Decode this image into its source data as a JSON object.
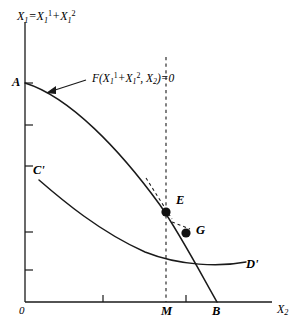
{
  "figure": {
    "type": "economics-transformation-curve-diagram",
    "background_color": "#ffffff",
    "line_color": "#1a1a1a"
  },
  "axes": {
    "y_axis": {
      "name": "vertical-axis",
      "label_parts": {
        "base": "X",
        "base_sub": "1",
        "equals": "=",
        "term1_base": "X",
        "term1_sub": "1",
        "term1_sup": "1",
        "plus": "+",
        "term2_base": "X",
        "term2_sub": "1",
        "term2_sup": "2"
      },
      "label_text": "X1 = X1^1 + X1^2",
      "tick_count": 5
    },
    "x_axis": {
      "name": "horizontal-axis",
      "label_base": "X",
      "label_sub": "2",
      "label_text": "X2",
      "origin_label": "0",
      "tick_count": 2
    }
  },
  "curves": [
    {
      "id": "AB",
      "name": "transformation-curve-AB",
      "start_label": "A",
      "end_label": "B",
      "description": "concave production possibility frontier from A on vertical axis to B on horizontal axis"
    },
    {
      "id": "CD",
      "name": "indifference-curve-CD",
      "start_label": "C'",
      "end_label": "D'",
      "description": "convex curve from C' falling to D'"
    }
  ],
  "labels": {
    "A": "A",
    "B": "B",
    "C_prime": "C'",
    "D_prime": "D'",
    "E": "E",
    "G": "G",
    "M": "M"
  },
  "annotation": {
    "name": "constraint-equation",
    "parts": {
      "f": "F(",
      "t1_base": "X",
      "t1_sub": "1",
      "t1_sup": "1",
      "plus": "+",
      "t2_base": "X",
      "t2_sub": "1",
      "t2_sup": "2",
      "comma": ",",
      "t3_base": "X",
      "t3_sub": "2",
      "close": ")=0"
    },
    "text": "F(X1^1 + X1^2, X2) = 0",
    "has_arrow": true
  },
  "points": [
    {
      "name": "point-E",
      "label": "E",
      "x": 166,
      "y": 212
    },
    {
      "name": "point-G",
      "label": "G",
      "x": 186,
      "y": 233
    }
  ],
  "guides": [
    {
      "name": "vertical-dashed-line-M",
      "style": "dashed",
      "x": 166
    },
    {
      "name": "tangent-dashed-at-E",
      "style": "dashed"
    },
    {
      "name": "tangent-dashed-at-G",
      "style": "dashed"
    }
  ]
}
